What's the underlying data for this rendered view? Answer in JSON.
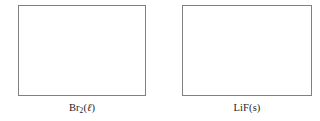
{
  "figure": {
    "kind": "worksheet-draw-boxes",
    "background_color": "#ffffff",
    "box_border_color": "#808084",
    "label_color": "#1c1c1c",
    "panels": [
      {
        "box_name": "empty-answer-box",
        "label_plain": "Br2(l)",
        "formula_main": "Br",
        "formula_subscript": "2",
        "state_open_paren": "(",
        "state_symbol": "ℓ",
        "state_close_paren": ")"
      },
      {
        "box_name": "empty-answer-box",
        "label_plain": "LiF(s)",
        "formula_main": "LiF",
        "formula_subscript": "",
        "state_open_paren": "(",
        "state_symbol": "s",
        "state_close_paren": ")"
      }
    ]
  }
}
